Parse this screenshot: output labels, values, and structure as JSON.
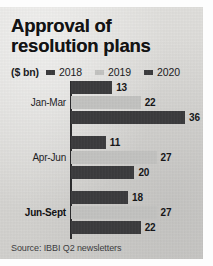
{
  "chart_data": {
    "type": "bar",
    "orientation": "horizontal",
    "title": "Approval of resolution plans",
    "title_line1": "Approval of",
    "title_line2": "resolution plans",
    "unit_label": "($ bn)",
    "xlabel": "",
    "ylabel": "",
    "grid": false,
    "legend_position": "top",
    "xlim": [
      0,
      36
    ],
    "categories": [
      "Jan-Mar",
      "Apr-Jun",
      "Jun-Sept"
    ],
    "series": [
      {
        "name": "2018",
        "color": "#3a3a3c",
        "values": [
          13,
          11,
          18
        ]
      },
      {
        "name": "2019",
        "color": "#c3c3c1",
        "values": [
          22,
          27,
          27
        ]
      },
      {
        "name": "2020",
        "color": "#3a3a3c",
        "values": [
          36,
          20,
          22
        ]
      }
    ],
    "source": "Source: IBBI Q2 newsletters"
  },
  "legend": {
    "unit": "($ bn)",
    "items": [
      {
        "label": "2018",
        "color": "#3a3a3c"
      },
      {
        "label": "2019",
        "color": "#c3c3c1"
      },
      {
        "label": "2020",
        "color": "#3a3a3c"
      }
    ]
  },
  "groups": [
    {
      "label": "Jan-Mar",
      "emphasis": false,
      "bars": [
        {
          "series": "2018",
          "value": "13",
          "color": "#3a3a3c"
        },
        {
          "series": "2019",
          "value": "22",
          "color": "#c3c3c1"
        },
        {
          "series": "2020",
          "value": "36",
          "color": "#3a3a3c"
        }
      ]
    },
    {
      "label": "Apr-Jun",
      "emphasis": false,
      "bars": [
        {
          "series": "2018",
          "value": "11",
          "color": "#3a3a3c"
        },
        {
          "series": "2019",
          "value": "27",
          "color": "#c3c3c1"
        },
        {
          "series": "2020",
          "value": "20",
          "color": "#3a3a3c"
        }
      ]
    },
    {
      "label": "Jun-Sept",
      "emphasis": true,
      "bars": [
        {
          "series": "2018",
          "value": "18",
          "color": "#3a3a3c"
        },
        {
          "series": "2019",
          "value": "27",
          "color": "#c3c3c1"
        },
        {
          "series": "2020",
          "value": "22",
          "color": "#3a3a3c"
        }
      ]
    }
  ],
  "footer": {
    "source": "Source: IBBI Q2 newsletters"
  }
}
